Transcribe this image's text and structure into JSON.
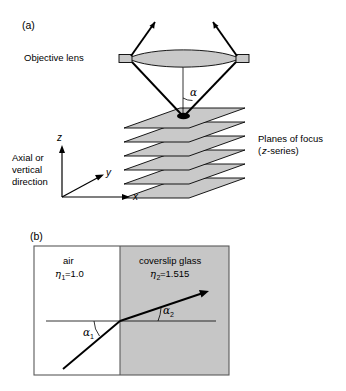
{
  "figure": {
    "panel_a": {
      "label": "(a)",
      "objective_lens_label": "Objective lens",
      "alpha_label": "α",
      "planes_label_line1": "Planes of focus",
      "planes_label_line2_italic": "z",
      "planes_label_line2_rest": "-series)",
      "planes_label_line2_open": "(",
      "axial_label_line1": "Axial or",
      "axial_label_line2": "vertical",
      "axial_label_line3": "direction",
      "axis_z": "z",
      "axis_y": "y",
      "axis_x": "x",
      "plane_count": 6,
      "plane_fill": "#c9c9c9",
      "lens_fill": "#c9c9c9"
    },
    "panel_b": {
      "label": "(b)",
      "air_label": "air",
      "air_eta_symbol": "η",
      "air_eta_sub": "1",
      "air_eta_value": "=1.0",
      "glass_label": "coverslip glass",
      "glass_eta_symbol": "η",
      "glass_eta_sub": "2",
      "glass_eta_value": "=1.515",
      "alpha1_symbol": "α",
      "alpha1_sub": "1",
      "alpha2_symbol": "α",
      "alpha2_sub": "2",
      "glass_fill": "#c6c6c6",
      "air_fill": "#ffffff",
      "border_color": "#5a5a5a"
    }
  }
}
